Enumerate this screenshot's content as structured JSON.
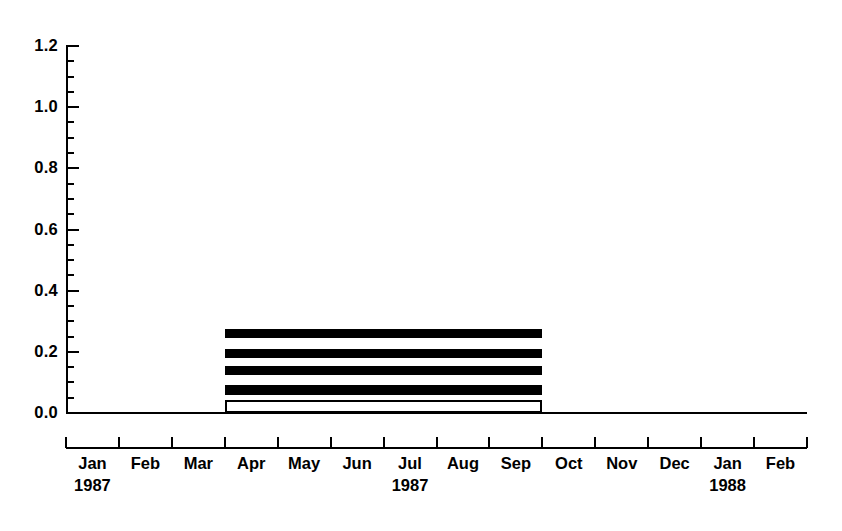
{
  "chart_data": {
    "type": "bar",
    "orientation": "horizontal-timeline",
    "title": "",
    "subtitle": "",
    "xlabel": "",
    "ylabel": "",
    "grid": false,
    "legend": null,
    "ylim": [
      0.0,
      1.2
    ],
    "y_major_step": 0.2,
    "y_minor_step": 0.05,
    "y_tick_labels": [
      "0.0",
      "0.2",
      "0.4",
      "0.6",
      "0.8",
      "1.0",
      "1.2"
    ],
    "y_tick_values": [
      0.0,
      0.2,
      0.4,
      0.6,
      0.8,
      1.0,
      1.2
    ],
    "categories": [
      "Jan",
      "Feb",
      "Mar",
      "Apr",
      "May",
      "Jun",
      "Jul",
      "Aug",
      "Sep",
      "Oct",
      "Nov",
      "Dec",
      "Jan",
      "Feb"
    ],
    "x_tick_labels": [
      "Jan",
      "Feb",
      "Mar",
      "Apr",
      "May",
      "Jun",
      "Jul",
      "Aug",
      "Sep",
      "Oct",
      "Nov",
      "Dec",
      "Jan",
      "Feb"
    ],
    "year_labels": [
      {
        "text": "1987",
        "under_month": "Jan",
        "index": 0
      },
      {
        "text": "1987",
        "under_month": "Jul",
        "index": 6
      },
      {
        "text": "1988",
        "under_month": "Jan",
        "index": 12
      }
    ],
    "xlim_months": [
      0,
      14
    ],
    "bars": [
      {
        "name": "bar-1",
        "start_month": "Apr",
        "end_month": "Sep",
        "start_index": 3,
        "end_index": 9,
        "y_top": 0.275,
        "y_bottom": 0.245,
        "style": "solid",
        "color": "#000000"
      },
      {
        "name": "bar-2",
        "start_month": "Apr",
        "end_month": "Sep",
        "start_index": 3,
        "end_index": 9,
        "y_top": 0.21,
        "y_bottom": 0.18,
        "style": "solid",
        "color": "#000000"
      },
      {
        "name": "bar-3",
        "start_month": "Apr",
        "end_month": "Sep",
        "start_index": 3,
        "end_index": 9,
        "y_top": 0.155,
        "y_bottom": 0.125,
        "style": "solid",
        "color": "#000000"
      },
      {
        "name": "bar-4",
        "start_month": "Apr",
        "end_month": "Sep",
        "start_index": 3,
        "end_index": 9,
        "y_top": 0.09,
        "y_bottom": 0.06,
        "style": "solid",
        "color": "#000000"
      },
      {
        "name": "bar-5",
        "start_month": "Apr",
        "end_month": "Sep",
        "start_index": 3,
        "end_index": 9,
        "y_top": 0.042,
        "y_bottom": 0.0,
        "style": "hollow",
        "color": "#ffffff",
        "border_color": "#000000"
      }
    ]
  },
  "axis": {
    "y_labels": [
      "1.2",
      "1.0",
      "0.8",
      "0.6",
      "0.4",
      "0.2",
      "0.0"
    ],
    "months": [
      "Jan",
      "Feb",
      "Mar",
      "Apr",
      "May",
      "Jun",
      "Jul",
      "Aug",
      "Sep",
      "Oct",
      "Nov",
      "Dec",
      "Jan",
      "Feb"
    ],
    "years": [
      "1987",
      "1987",
      "1988"
    ]
  },
  "caption": {
    "text": ""
  },
  "colors": {
    "background": "#ffffff",
    "foreground": "#000000",
    "bar_fill": "#000000",
    "bar_hollow_fill": "#ffffff"
  }
}
